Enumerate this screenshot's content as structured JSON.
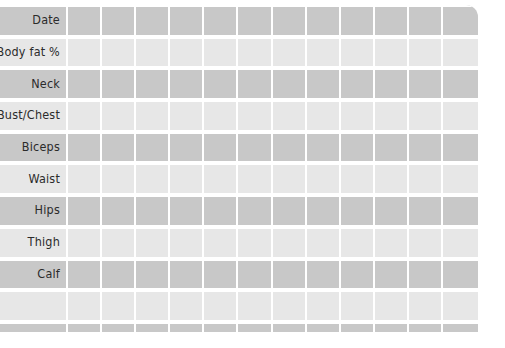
{
  "sheet": {
    "title": "Body Measurement Tracker",
    "label_column_width": 77,
    "data_column_count": 12,
    "colors": {
      "row_dark": "#c8c8c8",
      "row_light": "#e7e7e7",
      "gridline": "#ffffff",
      "label_text": "#2b2b2b",
      "page_background": "#ffffff"
    },
    "rows": [
      {
        "label": "Date",
        "band": "dark"
      },
      {
        "label": "Body fat %",
        "band": "light"
      },
      {
        "label": "Neck",
        "band": "dark"
      },
      {
        "label": "Bust/Chest",
        "band": "light"
      },
      {
        "label": "Biceps",
        "band": "dark"
      },
      {
        "label": "Waist",
        "band": "light"
      },
      {
        "label": "Hips",
        "band": "dark"
      },
      {
        "label": "Thigh",
        "band": "light"
      },
      {
        "label": "Calf",
        "band": "dark"
      },
      {
        "label": "",
        "band": "light"
      },
      {
        "label": "",
        "band": "dark"
      }
    ]
  }
}
